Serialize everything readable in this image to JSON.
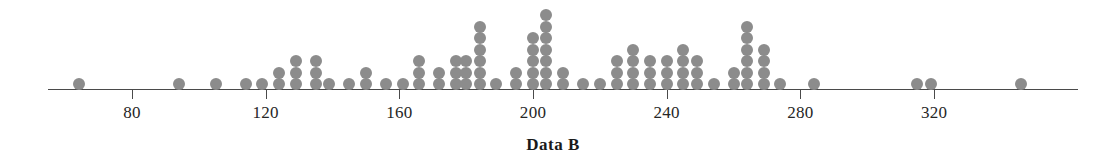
{
  "chart_data": {
    "type": "dotplot",
    "title": "",
    "xlabel": "Data B",
    "ylabel": "",
    "grid": false,
    "legend": null,
    "axis": {
      "tick_values": [
        80,
        120,
        160,
        200,
        240,
        280,
        320
      ],
      "tick_labels": [
        "80",
        "120",
        "160",
        "200",
        "240",
        "280",
        "320"
      ],
      "xlim": [
        55,
        363
      ],
      "line_color": "#4a4a4a"
    },
    "dot": {
      "color": "#8c8c8c",
      "diameter_px": 12,
      "vertical_pitch_px": 11.5
    },
    "stacks": [
      {
        "x": 64,
        "count": 1
      },
      {
        "x": 94,
        "count": 1
      },
      {
        "x": 105,
        "count": 1
      },
      {
        "x": 114,
        "count": 1
      },
      {
        "x": 119,
        "count": 1
      },
      {
        "x": 124,
        "count": 2
      },
      {
        "x": 129,
        "count": 3
      },
      {
        "x": 135,
        "count": 3
      },
      {
        "x": 139,
        "count": 1
      },
      {
        "x": 145,
        "count": 1
      },
      {
        "x": 150,
        "count": 2
      },
      {
        "x": 156,
        "count": 1
      },
      {
        "x": 161,
        "count": 1
      },
      {
        "x": 166,
        "count": 3
      },
      {
        "x": 172,
        "count": 2
      },
      {
        "x": 177,
        "count": 3
      },
      {
        "x": 180,
        "count": 3
      },
      {
        "x": 184,
        "count": 6
      },
      {
        "x": 189,
        "count": 1
      },
      {
        "x": 195,
        "count": 2
      },
      {
        "x": 200,
        "count": 5
      },
      {
        "x": 204,
        "count": 7
      },
      {
        "x": 209,
        "count": 2
      },
      {
        "x": 215,
        "count": 1
      },
      {
        "x": 220,
        "count": 1
      },
      {
        "x": 225,
        "count": 3
      },
      {
        "x": 230,
        "count": 4
      },
      {
        "x": 235,
        "count": 3
      },
      {
        "x": 240,
        "count": 3
      },
      {
        "x": 245,
        "count": 4
      },
      {
        "x": 249,
        "count": 3
      },
      {
        "x": 254,
        "count": 1
      },
      {
        "x": 260,
        "count": 2
      },
      {
        "x": 264,
        "count": 6
      },
      {
        "x": 269,
        "count": 4
      },
      {
        "x": 274,
        "count": 1
      },
      {
        "x": 284,
        "count": 1
      },
      {
        "x": 315,
        "count": 1
      },
      {
        "x": 319,
        "count": 1
      },
      {
        "x": 346,
        "count": 1
      }
    ],
    "values": [
      64,
      94,
      105,
      114,
      119,
      124,
      124,
      129,
      129,
      129,
      135,
      135,
      135,
      139,
      145,
      150,
      150,
      156,
      161,
      166,
      166,
      166,
      172,
      172,
      177,
      177,
      177,
      180,
      180,
      180,
      184,
      184,
      184,
      184,
      184,
      184,
      189,
      195,
      195,
      200,
      200,
      200,
      200,
      200,
      204,
      204,
      204,
      204,
      204,
      204,
      204,
      209,
      209,
      215,
      220,
      225,
      225,
      225,
      230,
      230,
      230,
      230,
      235,
      235,
      235,
      240,
      240,
      240,
      245,
      245,
      245,
      245,
      249,
      249,
      249,
      254,
      260,
      260,
      264,
      264,
      264,
      264,
      264,
      264,
      269,
      269,
      269,
      269,
      274,
      284,
      315,
      319,
      346
    ]
  }
}
